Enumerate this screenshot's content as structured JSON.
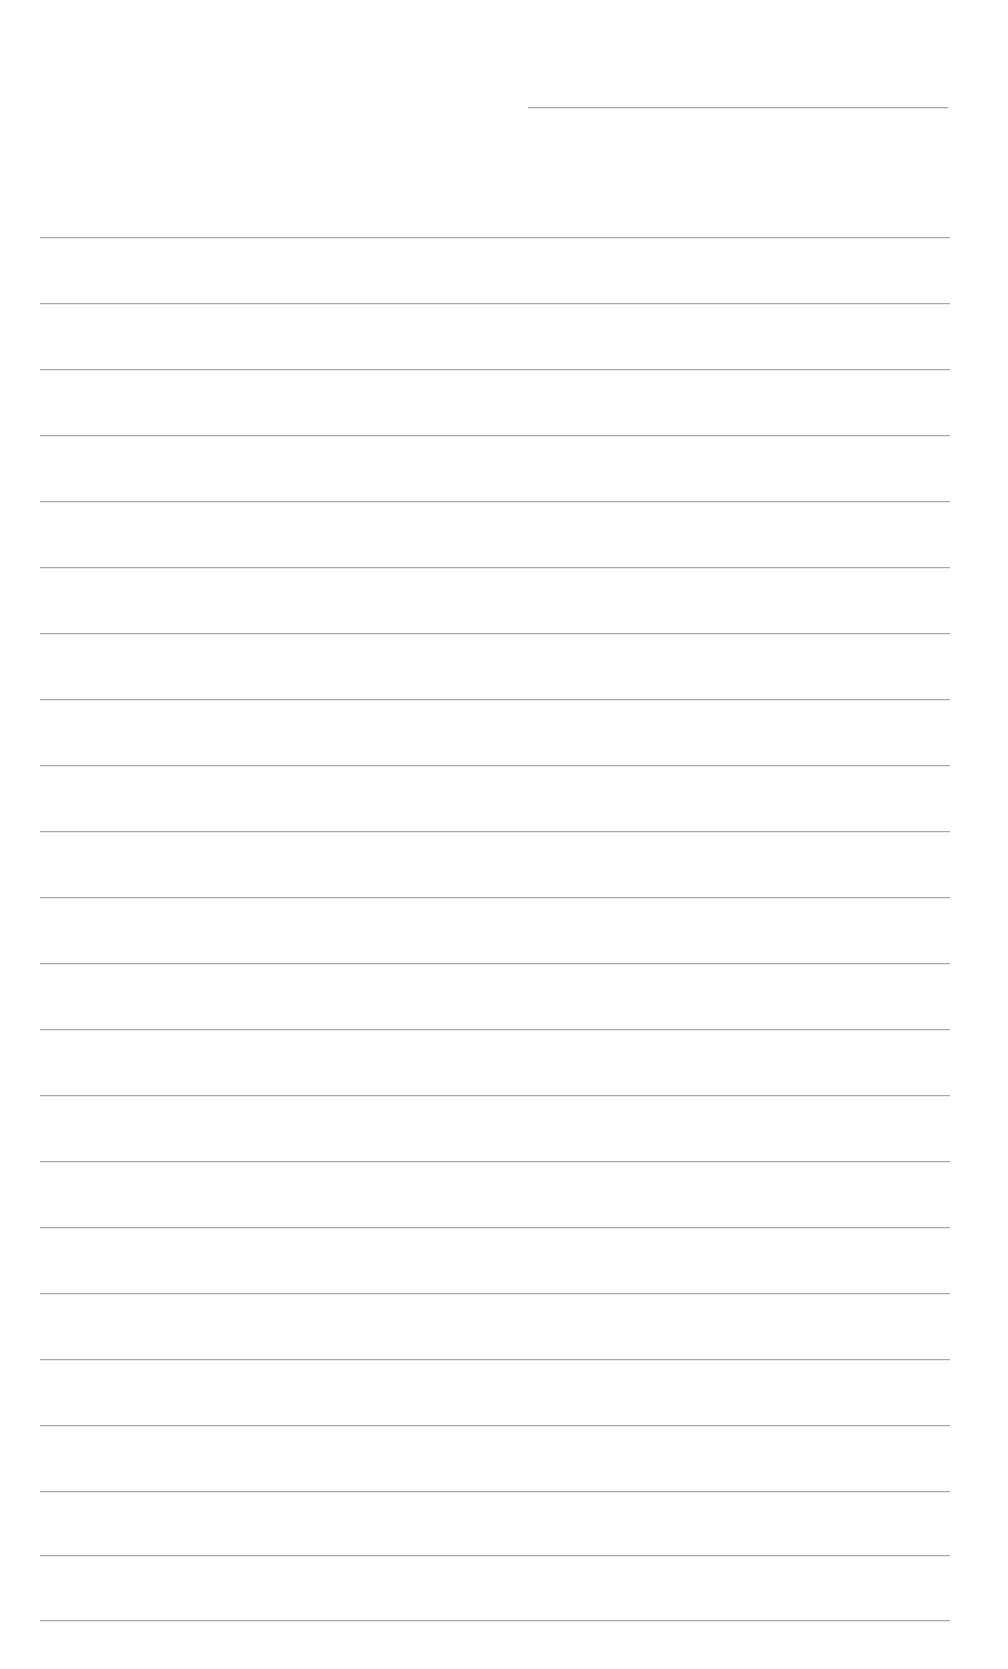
{
  "document": {
    "type": "blank lined sheet",
    "line_color": "#9a9a9a",
    "background_color": "#ffffff",
    "header_line": {
      "x_start": 528,
      "x_end": 948,
      "y": 107
    },
    "ruled_lines": {
      "x_start": 40,
      "x_end": 950,
      "y_positions": [
        237,
        303,
        369,
        435,
        501,
        567,
        633,
        699,
        765,
        831,
        897,
        963,
        1029,
        1095,
        1161,
        1227,
        1293,
        1359,
        1425,
        1491,
        1555,
        1620
      ]
    }
  }
}
